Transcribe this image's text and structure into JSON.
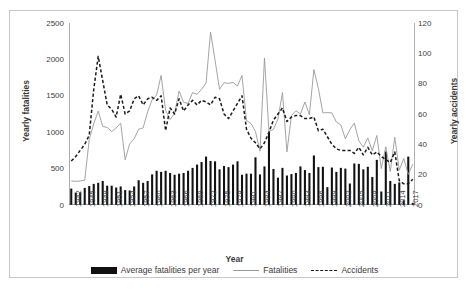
{
  "chart_data": {
    "type": "bar",
    "title": "",
    "xlabel": "Year",
    "ylabel": "Yearly fatalities",
    "y2label": "Yearly accidents",
    "ylim": [
      0,
      2500
    ],
    "y2lim": [
      0,
      120
    ],
    "grid": false,
    "legend_position": "bottom",
    "y_ticks": [
      "0",
      "500",
      "1000",
      "1500",
      "2000",
      "2500"
    ],
    "y2_ticks": [
      "0",
      "20",
      "40",
      "60",
      "80",
      "100",
      "120"
    ],
    "x_tick_labels": [
      "1942",
      "1945",
      "1948",
      "1951",
      "1954",
      "1957",
      "1960",
      "1963",
      "1966",
      "1969",
      "1972",
      "1975",
      "1978",
      "1981",
      "1984",
      "1987",
      "1990",
      "1993",
      "1996",
      "1999",
      "2002",
      "2005",
      "2008",
      "2011",
      "2014",
      "2017"
    ],
    "x_tick_step": 3,
    "categories": [
      1942,
      1943,
      1944,
      1945,
      1946,
      1947,
      1948,
      1949,
      1950,
      1951,
      1952,
      1953,
      1954,
      1955,
      1956,
      1957,
      1958,
      1959,
      1960,
      1961,
      1962,
      1963,
      1964,
      1965,
      1966,
      1967,
      1968,
      1969,
      1970,
      1971,
      1972,
      1973,
      1974,
      1975,
      1976,
      1977,
      1978,
      1979,
      1980,
      1981,
      1982,
      1983,
      1984,
      1985,
      1986,
      1987,
      1988,
      1989,
      1990,
      1991,
      1992,
      1993,
      1994,
      1995,
      1996,
      1997,
      1998,
      1999,
      2000,
      2001,
      2002,
      2003,
      2004,
      2005,
      2006,
      2007,
      2008,
      2009,
      2010,
      2011,
      2012,
      2013,
      2014,
      2015,
      2016,
      2017,
      2018
    ],
    "series": [
      {
        "name": "Average fatalities per year",
        "type": "bar",
        "axis": "left",
        "color": "#111111",
        "values": [
          225,
          170,
          175,
          235,
          260,
          290,
          305,
          330,
          265,
          265,
          240,
          255,
          205,
          200,
          255,
          340,
          305,
          330,
          420,
          470,
          455,
          470,
          440,
          415,
          430,
          440,
          470,
          510,
          555,
          590,
          665,
          605,
          600,
          490,
          535,
          520,
          555,
          600,
          415,
          430,
          430,
          655,
          420,
          530,
          1000,
          495,
          375,
          510,
          405,
          425,
          440,
          530,
          480,
          440,
          680,
          520,
          525,
          245,
          515,
          455,
          510,
          500,
          295,
          570,
          565,
          490,
          525,
          385,
          620,
          185,
          735,
          330,
          290,
          310,
          65,
          665,
          30
        ]
      },
      {
        "name": "Fatalities",
        "type": "line",
        "axis": "left",
        "color": "#9a9a9a",
        "values": [
          330,
          325,
          330,
          340,
          900,
          1115,
          1290,
          1080,
          1065,
          1010,
          1060,
          1125,
          620,
          840,
          910,
          1040,
          1060,
          1280,
          1445,
          1510,
          1780,
          1300,
          1175,
          1260,
          1565,
          1410,
          1395,
          1545,
          1520,
          1590,
          1675,
          2375,
          1990,
          1590,
          1680,
          1670,
          1685,
          1635,
          1780,
          1160,
          1120,
          1010,
          740,
          2020,
          1010,
          1040,
          1180,
          1545,
          730,
          1230,
          1295,
          1250,
          1415,
          1240,
          1860,
          1600,
          1265,
          1270,
          1265,
          1140,
          1100,
          910,
          1035,
          1125,
          880,
          795,
          920,
          745,
          955,
          500,
          800,
          460,
          930,
          480,
          640,
          420,
          560
        ]
      },
      {
        "name": "Accidents",
        "type": "line",
        "axis": "right",
        "color": "#1a1a1a",
        "dashed": true,
        "values": [
          29,
          32,
          36,
          40,
          46,
          76,
          98,
          82,
          66,
          63,
          58,
          73,
          60,
          62,
          70,
          72,
          66,
          70,
          71,
          69,
          72,
          49,
          64,
          60,
          70,
          62,
          66,
          69,
          66,
          69,
          68,
          66,
          71,
          70,
          60,
          57,
          62,
          67,
          72,
          50,
          44,
          41,
          37,
          41,
          48,
          56,
          60,
          64,
          55,
          58,
          59,
          59,
          57,
          57,
          58,
          49,
          50,
          45,
          40,
          37,
          36,
          36,
          36,
          34,
          38,
          33,
          38,
          33,
          35,
          32,
          30,
          28,
          35,
          16,
          14,
          14,
          17
        ]
      }
    ]
  },
  "axes": {
    "y_left_title": "Yearly fatalities",
    "y_right_title": "Yearly accidents",
    "x_title": "Year"
  },
  "legend": {
    "items": [
      {
        "label": "Average fatalities per year",
        "swatch": "bar-swatch"
      },
      {
        "label": "Fatalities",
        "swatch": "solid-line-swatch"
      },
      {
        "label": "Accidents",
        "swatch": "dashed-line-swatch"
      }
    ]
  }
}
